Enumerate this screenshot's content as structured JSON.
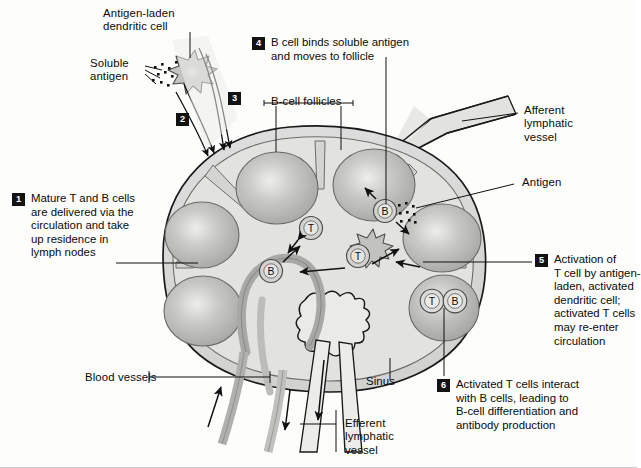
{
  "figure": {
    "type": "biology-diagram"
  },
  "labels": {
    "antigen_laden_dendritic_cell": "Antigen-laden\ndendritic cell",
    "soluble_antigen": "Soluble\nantigen",
    "b_cell_follicles": "B-cell follicles",
    "afferent_lymphatic_vessel": "Afferent\nlymphatic\nvessel",
    "antigen": "Antigen",
    "blood_vessels": "Blood vessels",
    "sinus": "Sinus",
    "efferent_lymphatic_vessel": "Efferent\nlymphatic\nvessel"
  },
  "steps": [
    {
      "number": "1",
      "text": "Mature T and B cells\nare delivered via the\ncirculation and take\nup residence in\nlymph nodes"
    },
    {
      "number": "2",
      "text": ""
    },
    {
      "number": "3",
      "text": ""
    },
    {
      "number": "4",
      "text": "B cell binds soluble antigen\nand moves to follicle"
    },
    {
      "number": "5",
      "text": "Activation of\nT cell by antigen-\nladen, activated\ndendritic cell;\nactivated T cells\nmay re-enter\ncirculation"
    },
    {
      "number": "6",
      "text": "Activated T cells interact\nwith B cells, leading to\nB-cell differentiation and\nantibody production"
    }
  ],
  "cells": {
    "t_label": "T",
    "b_label": "B",
    "instances": [
      {
        "name": "t-cell-left",
        "label": "T"
      },
      {
        "name": "b-cell-left",
        "label": "B"
      },
      {
        "name": "b-cell-upper-right",
        "label": "B"
      },
      {
        "name": "t-cell-with-dendritic",
        "label": "T"
      },
      {
        "name": "t-cell-in-follicle",
        "label": "T"
      },
      {
        "name": "b-cell-in-follicle",
        "label": "B"
      }
    ]
  },
  "colors": {
    "background": "#fdfdfc",
    "node_cortex": "#d7d7d5",
    "node_inner": "#e4e4e2",
    "follicle": "#b9b9b7",
    "follicle_core": "#dededc",
    "vessel_gray": "#a9a9a7",
    "outline": "#1a1a1a",
    "badge": "#121212",
    "text": "#0a0a0a"
  }
}
